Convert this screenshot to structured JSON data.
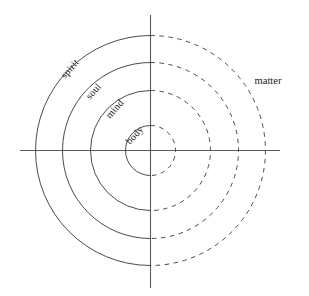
{
  "diagram": {
    "background_color": "#ffffff",
    "stroke_color": "#4a4a4a",
    "axis_color": "#5a5a5a",
    "text_color": "#1a1a1a",
    "center": {
      "x": 150.5,
      "y": 150.5
    },
    "axes": {
      "vertical": {
        "x": 150.5,
        "y1": 15,
        "y2": 288
      },
      "horizontal": {
        "y": 150.5,
        "x1": 20,
        "x2": 280
      }
    },
    "rings": [
      {
        "name": "body",
        "label": "body",
        "radius": 25,
        "left_style": "solid",
        "right_style": "dashed",
        "label_x": 139,
        "label_y": 144,
        "label_rotation": -48
      },
      {
        "name": "mind",
        "label": "mind",
        "radius": 60,
        "left_style": "solid",
        "right_style": "dashed",
        "label_x": 110,
        "label_y": 119,
        "label_rotation": -48
      },
      {
        "name": "soul",
        "label": "soul",
        "radius": 88,
        "left_style": "solid",
        "right_style": "dashed",
        "label_x": 90,
        "label_y": 100,
        "label_rotation": -48
      },
      {
        "name": "spirit",
        "label": "spirit",
        "radius": 115,
        "left_style": "solid",
        "right_style": "dashed",
        "label_x": 65,
        "label_y": 79,
        "label_rotation": -48
      }
    ],
    "outer_labels": [
      {
        "name": "matter",
        "label": "matter",
        "x": 268,
        "y": 84
      }
    ]
  }
}
